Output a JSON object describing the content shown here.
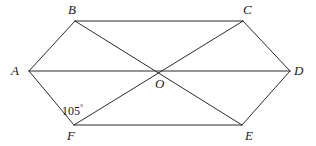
{
  "figure": {
    "kind": "geometry-diagram",
    "shape_name": "hexagon-with-diagonals",
    "background_color": "#ffffff",
    "stroke_color": "#2b2b2b",
    "stroke_width": 1,
    "width": 316,
    "height": 146
  },
  "vertices": [
    {
      "id": "A",
      "label": "A",
      "x": 29,
      "y": 71,
      "label_x": 11,
      "label_y": 64
    },
    {
      "id": "B",
      "label": "B",
      "x": 75,
      "y": 21,
      "label_x": 68,
      "label_y": 3
    },
    {
      "id": "C",
      "label": "C",
      "x": 243,
      "y": 21,
      "label_x": 243,
      "label_y": 3
    },
    {
      "id": "D",
      "label": "D",
      "x": 290,
      "y": 71,
      "label_x": 294,
      "label_y": 64
    },
    {
      "id": "E",
      "label": "E",
      "x": 242,
      "y": 125,
      "label_x": 245,
      "label_y": 129
    },
    {
      "id": "F",
      "label": "F",
      "x": 74,
      "y": 125,
      "label_x": 67,
      "label_y": 129
    },
    {
      "id": "O",
      "label": "O",
      "x": 160,
      "y": 71,
      "label_x": 155,
      "label_y": 77
    }
  ],
  "edges": [
    {
      "from": "A",
      "to": "B",
      "kind": "side"
    },
    {
      "from": "B",
      "to": "C",
      "kind": "side"
    },
    {
      "from": "C",
      "to": "D",
      "kind": "side"
    },
    {
      "from": "D",
      "to": "E",
      "kind": "side"
    },
    {
      "from": "E",
      "to": "F",
      "kind": "side"
    },
    {
      "from": "F",
      "to": "A",
      "kind": "side"
    },
    {
      "from": "A",
      "to": "D",
      "kind": "diagonal"
    },
    {
      "from": "B",
      "to": "E",
      "kind": "diagonal"
    },
    {
      "from": "C",
      "to": "F",
      "kind": "diagonal"
    }
  ],
  "annotations": {
    "angle_at_F": {
      "value": "105",
      "degree_symbol": "°",
      "text": "105°",
      "at_vertex": "F",
      "between": [
        "A",
        "C"
      ],
      "label_x": 62,
      "label_y": 104
    }
  }
}
